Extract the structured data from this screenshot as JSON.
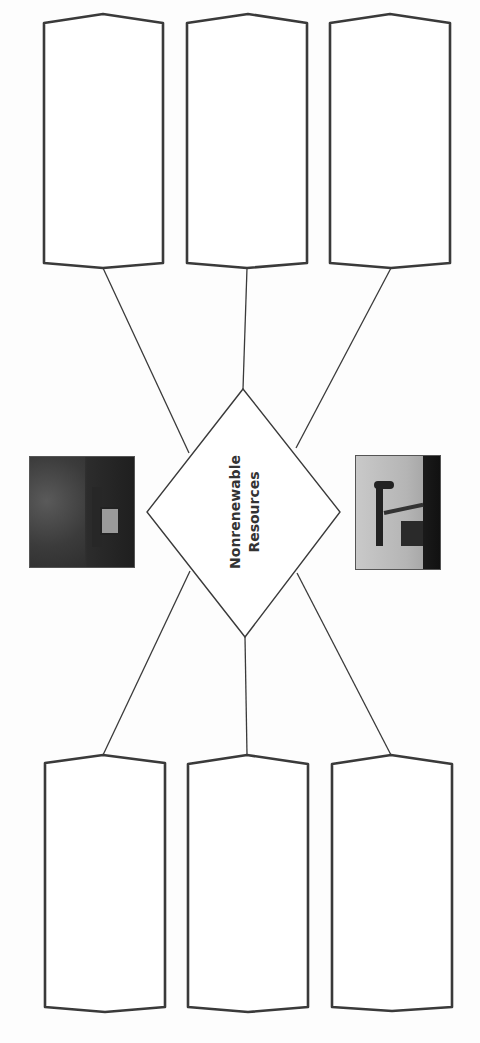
{
  "diagram": {
    "type": "graphic-organizer",
    "center": {
      "shape": "diamond",
      "label_line1": "Nonrenewable",
      "label_line2": "Resources"
    },
    "top_boxes": [
      {
        "id": "top-left",
        "text": ""
      },
      {
        "id": "top-middle",
        "text": ""
      },
      {
        "id": "top-right",
        "text": ""
      }
    ],
    "bottom_boxes": [
      {
        "id": "bottom-left",
        "text": ""
      },
      {
        "id": "bottom-middle",
        "text": ""
      },
      {
        "id": "bottom-right",
        "text": ""
      }
    ],
    "images": [
      {
        "id": "mining-photo",
        "depicts": "coal mine / mining machinery"
      },
      {
        "id": "oil-pump-photo",
        "depicts": "oil pumpjack"
      }
    ],
    "colors": {
      "stroke": "#3a3a3a",
      "background": "#ffffff",
      "text": "#333333"
    }
  }
}
